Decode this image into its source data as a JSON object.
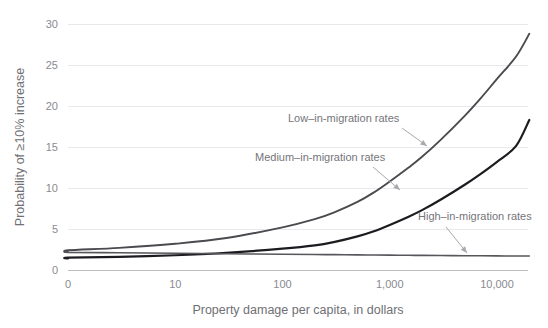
{
  "chart_data": {
    "type": "line",
    "title": "",
    "xlabel": "Property damage per capita, in dollars",
    "ylabel": "Probability of ≥10% increase",
    "xticklabels": [
      "0",
      "10",
      "100",
      "1,000",
      "10,000"
    ],
    "xtickpositions": [
      0,
      10,
      100,
      1000,
      10000
    ],
    "yticklabels": [
      "0",
      "5",
      "10",
      "15",
      "20",
      "25",
      "30"
    ],
    "ylim": [
      0,
      30
    ],
    "grid": true,
    "legend_position": "inline-annotations",
    "x": [
      0,
      1,
      3,
      10,
      30,
      100,
      200,
      300,
      500,
      700,
      1000,
      1500,
      2000,
      3000,
      5000,
      7000,
      10000,
      15000,
      20000
    ],
    "series": [
      {
        "name": "Low–in-migration rates",
        "color": "#4a4a4f",
        "values": [
          2.2,
          2.4,
          2.7,
          3.2,
          3.9,
          5.2,
          6.2,
          7.0,
          8.3,
          9.4,
          10.8,
          12.5,
          13.8,
          15.9,
          18.8,
          20.9,
          23.3,
          26.0,
          28.8
        ]
      },
      {
        "name": "Medium–in-migration rates",
        "color": "#1c1c20",
        "values": [
          1.4,
          1.5,
          1.6,
          1.8,
          2.1,
          2.6,
          3.0,
          3.4,
          4.1,
          4.7,
          5.5,
          6.5,
          7.3,
          8.6,
          10.4,
          11.7,
          13.2,
          15.1,
          18.3
        ]
      },
      {
        "name": "High–in-migration rates",
        "color": "#56565b",
        "values": [
          2.2,
          2.15,
          2.1,
          2.05,
          1.98,
          1.92,
          1.89,
          1.87,
          1.85,
          1.83,
          1.81,
          1.79,
          1.78,
          1.76,
          1.74,
          1.73,
          1.72,
          1.71,
          1.7
        ]
      }
    ],
    "annotations": [
      {
        "label": "Low–in-migration rates",
        "text_x": 288,
        "text_y": 122,
        "arrow_x1": 402,
        "arrow_y1": 128,
        "arrow_x2": 427,
        "arrow_y2": 146
      },
      {
        "label": "Medium–in-migration rates",
        "text_x": 255,
        "text_y": 161,
        "arrow_x1": 373,
        "arrow_y1": 167,
        "arrow_x2": 400,
        "arrow_y2": 190
      },
      {
        "label": "High–in-migration rates",
        "text_x": 418,
        "text_y": 220,
        "arrow_x1": 446,
        "arrow_y1": 227,
        "arrow_x2": 467,
        "arrow_y2": 253
      }
    ]
  }
}
